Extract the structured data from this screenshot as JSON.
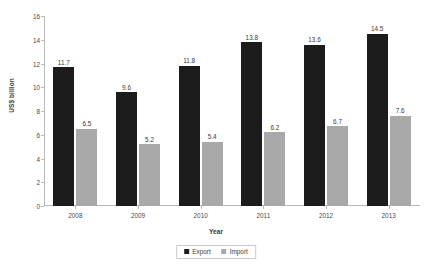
{
  "chart_data": {
    "type": "bar",
    "title": "",
    "subtitle": "",
    "xlabel": "Year",
    "ylabel": "US$ billion",
    "categories": [
      "2008",
      "2009",
      "2010",
      "2011",
      "2012",
      "2013"
    ],
    "series": [
      {
        "name": "Export",
        "color": "#1c1c1c",
        "values": [
          11.7,
          9.6,
          11.8,
          13.8,
          13.6,
          14.5
        ],
        "labels": [
          "11.7",
          "9.6",
          "11.8",
          "13.8",
          "13.6",
          "14.5"
        ]
      },
      {
        "name": "Import",
        "color": "#a9a9a9",
        "values": [
          6.5,
          5.2,
          5.4,
          6.2,
          6.7,
          7.6
        ],
        "labels": [
          "6.5",
          "5.2",
          "5.4",
          "6.2",
          "6.7",
          "7.6"
        ]
      }
    ],
    "ylim": [
      0,
      16
    ],
    "yticks": [
      0,
      2,
      4,
      6,
      8,
      10,
      12,
      14,
      16
    ],
    "ytick_labels": [
      "0",
      "2",
      "4",
      "6",
      "8",
      "10",
      "12",
      "14",
      "16"
    ],
    "grid": false,
    "legend_position": "bottom",
    "data_labels": true
  },
  "legend": {
    "items": [
      {
        "label": "Export",
        "swatch": "legend-swatch-export"
      },
      {
        "label": "Import",
        "swatch": "legend-swatch-import"
      }
    ]
  },
  "colors": {
    "export": "#1c1c1c",
    "import": "#a9a9a9",
    "axis": "#b9b9b9",
    "text": "#3b3b3b",
    "background": "#ffffff"
  }
}
